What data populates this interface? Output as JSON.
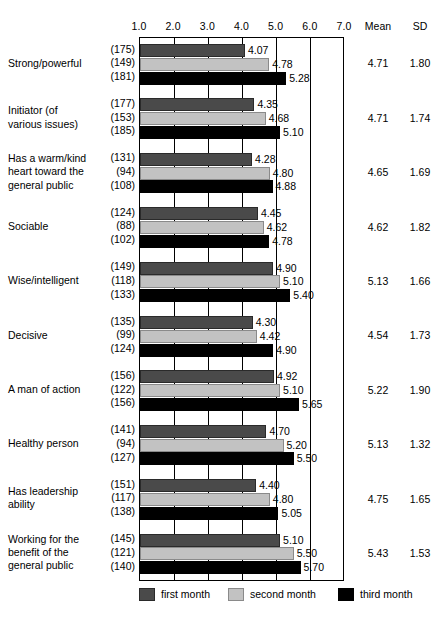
{
  "chart_data": {
    "type": "bar",
    "orientation": "horizontal",
    "title": "",
    "xlabel": "",
    "ylabel": "",
    "xlim": [
      1.0,
      7.0
    ],
    "xticks": [
      "1.0",
      "2.0",
      "3.0",
      "4.0",
      "5.0",
      "6.0",
      "7.0"
    ],
    "xtick_values": [
      1.0,
      2.0,
      3.0,
      4.0,
      5.0,
      6.0,
      7.0
    ],
    "grid": true,
    "legend_position": "bottom",
    "series": [
      {
        "name": "first month",
        "color": "#4a4a4a"
      },
      {
        "name": "second month",
        "color": "#c2c2c2"
      },
      {
        "name": "third month",
        "color": "#000000"
      }
    ],
    "extra_columns": [
      "Mean",
      "SD"
    ],
    "categories": [
      {
        "label": [
          "Strong/powerful"
        ],
        "n": [
          "(175)",
          "(149)",
          "(181)"
        ],
        "values": [
          4.07,
          4.78,
          5.28
        ],
        "value_labels": [
          "4.07",
          "4.78",
          "5.28"
        ],
        "mean": "4.71",
        "sd": "1.80"
      },
      {
        "label": [
          "Initiator (of",
          "various issues)"
        ],
        "n": [
          "(177)",
          "(153)",
          "(185)"
        ],
        "values": [
          4.35,
          4.68,
          5.1
        ],
        "value_labels": [
          "4.35",
          "4.68",
          "5.10"
        ],
        "mean": "4.71",
        "sd": "1.74"
      },
      {
        "label": [
          "Has a warm/kind",
          "heart toward the",
          "general public"
        ],
        "n": [
          "(131)",
          "(94)",
          "(108)"
        ],
        "values": [
          4.28,
          4.8,
          4.88
        ],
        "value_labels": [
          "4.28",
          "4.80",
          "4.88"
        ],
        "mean": "4.65",
        "sd": "1.69"
      },
      {
        "label": [
          "Sociable"
        ],
        "n": [
          "(124)",
          "(88)",
          "(102)"
        ],
        "values": [
          4.45,
          4.62,
          4.78
        ],
        "value_labels": [
          "4.45",
          "4.62",
          "4.78"
        ],
        "mean": "4.62",
        "sd": "1.82"
      },
      {
        "label": [
          "Wise/intelligent"
        ],
        "n": [
          "(149)",
          "(118)",
          "(133)"
        ],
        "values": [
          4.9,
          5.1,
          5.4
        ],
        "value_labels": [
          "4.90",
          "5.10",
          "5.40"
        ],
        "mean": "5.13",
        "sd": "1.66"
      },
      {
        "label": [
          "Decisive"
        ],
        "n": [
          "(135)",
          "(99)",
          "(124)"
        ],
        "values": [
          4.3,
          4.42,
          4.9
        ],
        "value_labels": [
          "4.30",
          "4.42",
          "4.90"
        ],
        "mean": "4.54",
        "sd": "1.73"
      },
      {
        "label": [
          "A man of action"
        ],
        "n": [
          "(156)",
          "(122)",
          "(156)"
        ],
        "values": [
          4.92,
          5.1,
          5.65
        ],
        "value_labels": [
          "4.92",
          "5.10",
          "5.65"
        ],
        "mean": "5.22",
        "sd": "1.90"
      },
      {
        "label": [
          "Healthy person"
        ],
        "n": [
          "(141)",
          "(94)",
          "(127)"
        ],
        "values": [
          4.7,
          5.2,
          5.5
        ],
        "value_labels": [
          "4.70",
          "5.20",
          "5.50"
        ],
        "mean": "5.13",
        "sd": "1.32"
      },
      {
        "label": [
          "Has leadership",
          "ability"
        ],
        "n": [
          "(151)",
          "(117)",
          "(138)"
        ],
        "values": [
          4.4,
          4.8,
          5.05
        ],
        "value_labels": [
          "4.40",
          "4.80",
          "5.05"
        ],
        "mean": "4.75",
        "sd": "1.65"
      },
      {
        "label": [
          "Working for the",
          "benefit of the",
          "general public"
        ],
        "n": [
          "(145)",
          "(121)",
          "(140)"
        ],
        "values": [
          5.1,
          5.5,
          5.7
        ],
        "value_labels": [
          "5.10",
          "5.50",
          "5.70"
        ],
        "mean": "5.43",
        "sd": "1.53"
      }
    ]
  }
}
